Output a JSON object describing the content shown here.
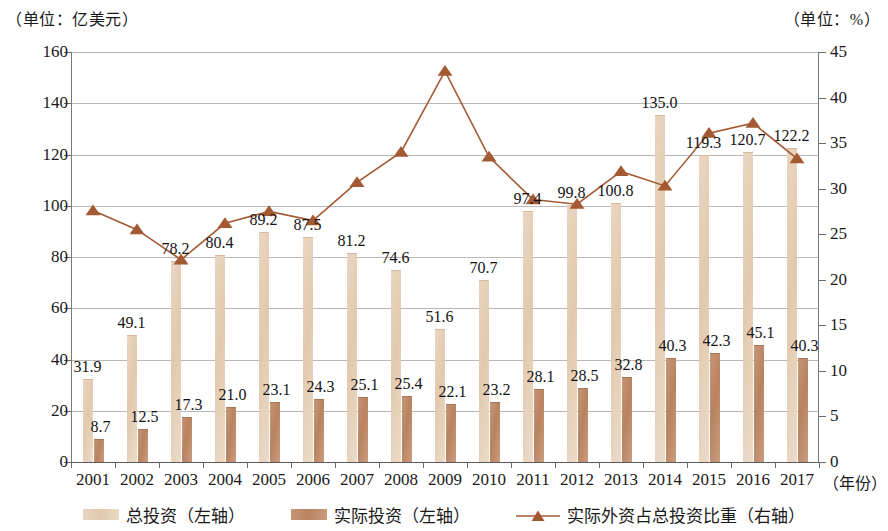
{
  "units": {
    "left": "（单位：亿美元）",
    "right": "（单位：%）"
  },
  "axis_title_x": "（年份）",
  "legend": {
    "items": [
      {
        "label": "总投资（左轴）",
        "color": "#e2c9ae",
        "marker": "bar"
      },
      {
        "label": "实际投资（左轴）",
        "color": "#b9835f",
        "marker": "bar"
      },
      {
        "label": "实际外资占总投资比重（右轴）",
        "color": "#a35a33",
        "marker": "line-triangle"
      }
    ]
  },
  "chart_data": {
    "type": "bar",
    "title": "",
    "subtitle": "",
    "xlabel": "（年份）",
    "ylabel": "（单位：亿美元）",
    "y2label": "（单位：%）",
    "ylim": [
      0,
      160
    ],
    "y2lim": [
      0,
      45
    ],
    "yticks": [
      0,
      20,
      40,
      60,
      80,
      100,
      120,
      140,
      160
    ],
    "y2ticks": [
      0,
      5,
      10,
      15,
      20,
      25,
      30,
      35,
      40,
      45
    ],
    "grid": true,
    "legend_position": "bottom",
    "categories": [
      "2001",
      "2002",
      "2003",
      "2004",
      "2005",
      "2006",
      "2007",
      "2008",
      "2009",
      "2010",
      "2011",
      "2012",
      "2013",
      "2014",
      "2015",
      "2016",
      "2017"
    ],
    "series": [
      {
        "name": "总投资（左轴）",
        "type": "bar",
        "axis": "left",
        "color": "#e2c9ae",
        "values": [
          31.9,
          49.1,
          78.2,
          80.4,
          89.2,
          87.5,
          81.2,
          74.6,
          51.6,
          70.7,
          97.4,
          99.8,
          100.8,
          135.0,
          119.3,
          120.7,
          122.2
        ],
        "labels": [
          "31.9",
          "49.1",
          "78.2",
          "80.4",
          "89.2",
          "87.5",
          "81.2",
          "74.6",
          "51.6",
          "70.7",
          "97.4",
          "99.8",
          "100.8",
          "135.0",
          "119.3",
          "120.7",
          "122.2"
        ]
      },
      {
        "name": "实际投资（左轴）",
        "type": "bar",
        "axis": "left",
        "color": "#b9835f",
        "values": [
          8.7,
          12.5,
          17.3,
          21.0,
          23.1,
          24.3,
          25.1,
          25.4,
          22.1,
          23.2,
          28.1,
          28.5,
          32.8,
          40.3,
          42.3,
          45.1,
          40.3
        ],
        "labels": [
          "8.7",
          "12.5",
          "17.3",
          "21.0",
          "23.1",
          "24.3",
          "25.1",
          "25.4",
          "22.1",
          "23.2",
          "28.1",
          "28.5",
          "32.8",
          "40.3",
          "42.3",
          "45.1",
          "40.3"
        ]
      },
      {
        "name": "实际外资占总投资比重（右轴）",
        "type": "line",
        "axis": "right",
        "color": "#a35a33",
        "values": [
          27.6,
          25.5,
          22.2,
          26.2,
          27.5,
          26.5,
          30.7,
          34.0,
          42.9,
          33.5,
          28.8,
          28.3,
          31.9,
          30.3,
          36.1,
          37.2,
          33.3
        ]
      }
    ]
  }
}
